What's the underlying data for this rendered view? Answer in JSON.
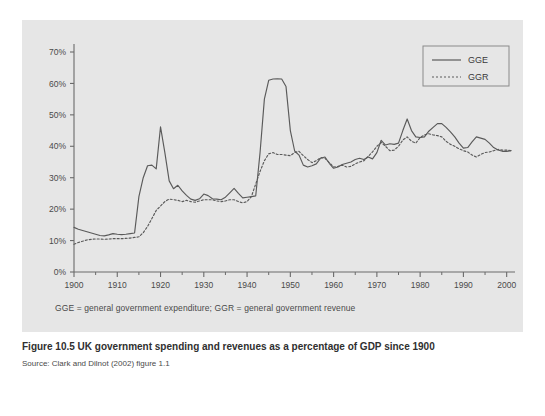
{
  "figure": {
    "caption_title": "Figure 10.5  UK government spending and revenues as a percentage of GDP since 1900",
    "caption_source": "Source: Clark and Dilnot (2002) figure 1.1",
    "note": "GGE = general government expenditure; GGR = general government revenue",
    "panel_bg": "#e6e6e6",
    "line_color": "#5a5a5a",
    "axis_color": "#6a6a6a"
  },
  "chart_data": {
    "type": "line",
    "title": "UK government spending and revenues as a percentage of GDP since 1900",
    "xlabel": "",
    "ylabel": "",
    "xlim": [
      1900,
      2001
    ],
    "ylim": [
      0,
      70
    ],
    "ytick_labels": [
      "0%",
      "10%",
      "20%",
      "30%",
      "40%",
      "50%",
      "60%",
      "70%"
    ],
    "ytick_values": [
      0,
      10,
      20,
      30,
      40,
      50,
      60,
      70
    ],
    "xtick_labels": [
      "1900",
      "1910",
      "1920",
      "1930",
      "1940",
      "1950",
      "1960",
      "1970",
      "1980",
      "1990",
      "2000"
    ],
    "xtick_values": [
      1900,
      1910,
      1920,
      1930,
      1940,
      1950,
      1960,
      1970,
      1980,
      1990,
      2000
    ],
    "minor_xtick_values": [
      1905,
      1915,
      1925,
      1935,
      1945,
      1955,
      1965,
      1975,
      1985,
      1995
    ],
    "grid": false,
    "legend_position": "top-right",
    "legend_entries": [
      "GGE",
      "GGR"
    ],
    "x": [
      1900,
      1901,
      1902,
      1903,
      1904,
      1905,
      1906,
      1907,
      1908,
      1909,
      1910,
      1911,
      1912,
      1913,
      1914,
      1915,
      1916,
      1917,
      1918,
      1919,
      1920,
      1921,
      1922,
      1923,
      1924,
      1925,
      1926,
      1927,
      1928,
      1929,
      1930,
      1931,
      1932,
      1933,
      1934,
      1935,
      1936,
      1937,
      1938,
      1939,
      1940,
      1941,
      1942,
      1943,
      1944,
      1945,
      1946,
      1947,
      1948,
      1949,
      1950,
      1951,
      1952,
      1953,
      1954,
      1955,
      1956,
      1957,
      1958,
      1959,
      1960,
      1961,
      1962,
      1963,
      1964,
      1965,
      1966,
      1967,
      1968,
      1969,
      1970,
      1971,
      1972,
      1973,
      1974,
      1975,
      1976,
      1977,
      1978,
      1979,
      1980,
      1981,
      1982,
      1983,
      1984,
      1985,
      1986,
      1987,
      1988,
      1989,
      1990,
      1991,
      1992,
      1993,
      1994,
      1995,
      1996,
      1997,
      1998,
      1999,
      2000,
      2001
    ],
    "series": [
      {
        "name": "GGE",
        "style": "solid",
        "values": [
          14.2,
          13.6,
          13.2,
          12.8,
          12.4,
          12.0,
          11.6,
          11.5,
          11.8,
          12.2,
          12.0,
          11.9,
          12.0,
          12.2,
          12.4,
          24.0,
          30.0,
          33.8,
          34.0,
          32.8,
          46.2,
          38.0,
          29.0,
          26.5,
          27.6,
          25.8,
          24.4,
          23.2,
          22.8,
          23.3,
          24.8,
          24.3,
          23.3,
          23.2,
          23.0,
          23.8,
          25.2,
          26.6,
          25.0,
          23.6,
          23.8,
          24.0,
          24.2,
          38.0,
          55.0,
          61.0,
          61.4,
          61.5,
          61.4,
          59.0,
          45.0,
          38.5,
          37.2,
          34.0,
          33.4,
          33.8,
          34.4,
          36.2,
          36.6,
          34.6,
          33.0,
          33.4,
          34.2,
          34.6,
          35.0,
          35.8,
          36.2,
          35.8,
          36.6,
          36.0,
          38.0,
          41.9,
          40.4,
          40.8,
          40.6,
          41.0,
          45.0,
          48.7,
          45.0,
          43.0,
          42.8,
          43.0,
          44.8,
          46.0,
          47.2,
          47.2,
          46.0,
          44.6,
          43.0,
          41.0,
          39.4,
          39.6,
          41.4,
          43.0,
          42.6,
          42.2,
          41.0,
          39.6,
          38.8,
          38.4,
          38.4,
          38.6
        ]
      },
      {
        "name": "GGR",
        "style": "dotted",
        "values": [
          8.8,
          9.4,
          9.8,
          10.2,
          10.4,
          10.5,
          10.5,
          10.4,
          10.5,
          10.6,
          10.6,
          10.6,
          10.7,
          10.8,
          11.0,
          11.2,
          12.5,
          14.5,
          17.0,
          19.6,
          21.0,
          22.4,
          23.2,
          23.0,
          22.8,
          22.4,
          22.8,
          22.4,
          22.2,
          22.6,
          23.0,
          23.0,
          23.0,
          22.6,
          22.4,
          22.6,
          23.0,
          23.0,
          22.4,
          22.0,
          22.4,
          24.0,
          28.0,
          32.0,
          35.4,
          37.6,
          38.0,
          37.4,
          37.4,
          37.2,
          37.0,
          38.0,
          38.4,
          37.0,
          35.8,
          34.8,
          35.4,
          36.4,
          36.2,
          34.8,
          33.4,
          33.6,
          34.0,
          33.4,
          33.6,
          34.4,
          35.0,
          35.4,
          36.8,
          38.2,
          40.0,
          41.2,
          40.0,
          38.6,
          38.8,
          40.0,
          42.0,
          43.0,
          41.6,
          41.0,
          42.8,
          43.6,
          44.0,
          43.6,
          43.4,
          43.0,
          41.6,
          40.6,
          40.0,
          39.2,
          38.6,
          38.2,
          37.2,
          36.6,
          37.4,
          38.0,
          38.2,
          38.6,
          39.0,
          38.8,
          38.8,
          38.6
        ]
      }
    ]
  }
}
